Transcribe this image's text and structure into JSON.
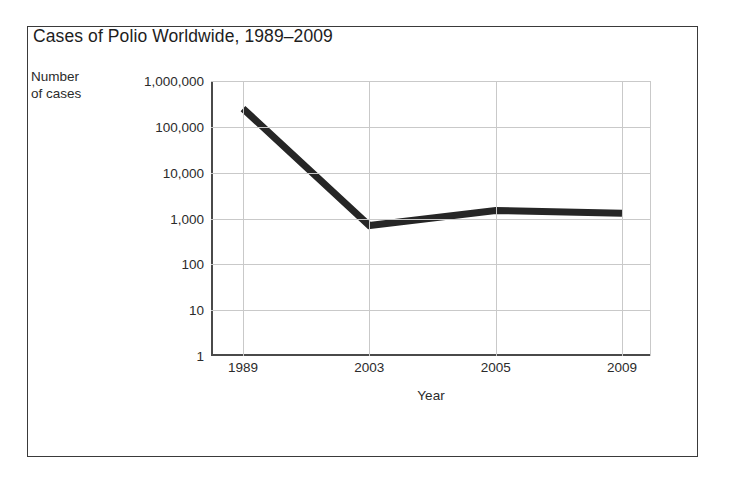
{
  "figure": {
    "title": "Cases of Polio Worldwide, 1989–2009",
    "y_axis_title_line1": "Number",
    "y_axis_title_line2": "of cases",
    "x_axis_title": "Year",
    "line_color": "#262626",
    "grid_color": "#c9c9c9",
    "axis_color": "#4a4a4a",
    "text_color": "#2b2b2b",
    "background": "#ffffff"
  },
  "chart_data": {
    "type": "line",
    "title": "Cases of Polio Worldwide, 1989–2009",
    "xlabel": "Year",
    "ylabel": "Number of cases",
    "yscale": "log",
    "ylim": [
      1,
      1000000
    ],
    "grid": true,
    "legend": "none",
    "categories": [
      "1989",
      "2003",
      "2005",
      "2009"
    ],
    "ytick_labels": [
      "1,000,000",
      "100,000",
      "10,000",
      "1,000",
      "100",
      "10",
      "1"
    ],
    "ytick_values": [
      1000000,
      100000,
      10000,
      1000,
      100,
      10,
      1
    ],
    "series": [
      {
        "name": "Cases of polio",
        "values": [
          250000,
          700,
          1500,
          1300
        ]
      }
    ]
  }
}
